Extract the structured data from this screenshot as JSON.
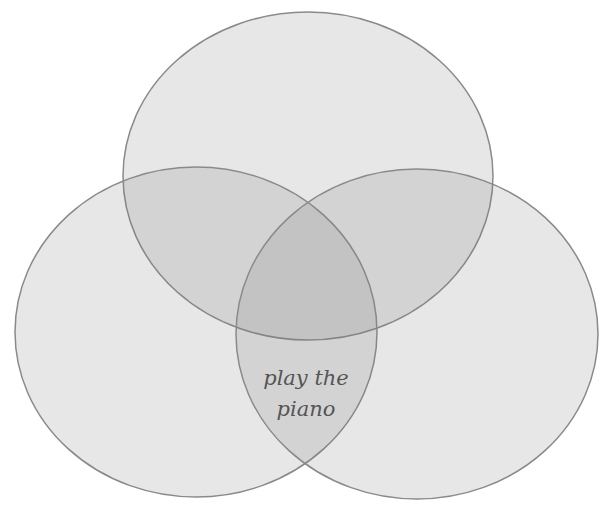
{
  "diagram": {
    "type": "venn",
    "set_count": 3,
    "circles": [
      {
        "name": "top",
        "cx": 308,
        "cy": 176,
        "rx": 185,
        "ry": 164
      },
      {
        "name": "left",
        "cx": 196,
        "cy": 332,
        "rx": 181,
        "ry": 165
      },
      {
        "name": "right",
        "cx": 417,
        "cy": 334,
        "rx": 181,
        "ry": 165
      }
    ],
    "region_labels": [
      {
        "region": "left-right-overlap-below-top",
        "line1": "play the",
        "line2": "piano"
      }
    ],
    "colors": {
      "fill": "#e6e6e6",
      "double_overlap": "#cccccc",
      "triple_overlap": "#b3b3b3",
      "stroke": "#8a8a8a",
      "text": "#555555"
    }
  }
}
